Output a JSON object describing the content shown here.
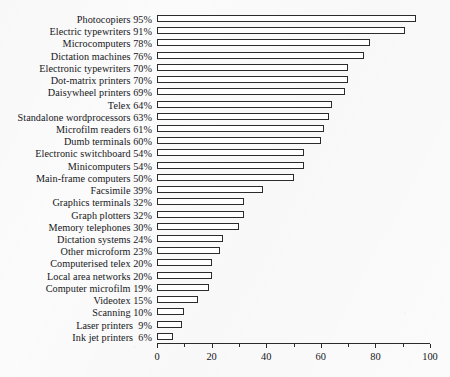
{
  "chart_data": {
    "type": "bar",
    "orientation": "horizontal",
    "title": "",
    "subtitle": "",
    "xlabel": "",
    "ylabel": "",
    "xlim": [
      0,
      100
    ],
    "ylim": null,
    "grid": false,
    "legend": null,
    "legend_position": "none",
    "value_suffix": "%",
    "xticks": [
      0,
      20,
      40,
      60,
      80,
      100
    ],
    "xtick_labels": [
      "0",
      "20",
      "40",
      "60",
      "80",
      "100"
    ],
    "minor_xticks": [
      10,
      30,
      50,
      70,
      90
    ],
    "categories": [
      "Photocopiers",
      "Electric typewriters",
      "Microcomputers",
      "Dictation machines",
      "Electronic typewriters",
      "Dot-matrix printers",
      "Daisywheel printers",
      "Telex",
      "Standalone wordprocessors",
      "Microfilm readers",
      "Dumb terminals",
      "Electronic switchboard",
      "Minicomputers",
      "Main-frame computers",
      "Facsimile",
      "Graphics terminals",
      "Graph plotters",
      "Memory telephones",
      "Dictation systems",
      "Other microform",
      "Computerised telex",
      "Local area networks",
      "Computer microfilm",
      "Videotex",
      "Scanning",
      "Laser printers",
      "Ink jet printers"
    ],
    "values": [
      95,
      91,
      78,
      76,
      70,
      70,
      69,
      64,
      63,
      61,
      60,
      54,
      54,
      50,
      39,
      32,
      32,
      30,
      24,
      23,
      20,
      20,
      19,
      15,
      10,
      9,
      6
    ],
    "row_labels": [
      "Photocopiers 95%",
      "Electric typewriters 91%",
      "Microcomputers 78%",
      "Dictation machines 76%",
      "Electronic typewriters 70%",
      "Dot-matrix printers 70%",
      "Daisywheel printers 69%",
      "Telex 64%",
      "Standalone wordprocessors 63%",
      "Microfilm readers 61%",
      "Dumb terminals 60%",
      "Electronic switchboard 54%",
      "Minicomputers 54%",
      "Main-frame computers 50%",
      "Facsimile 39%",
      "Graphics terminals 32%",
      "Graph plotters 32%",
      "Memory telephones 30%",
      "Dictation systems 24%",
      "Other microform 23%",
      "Computerised telex 20%",
      "Local area networks 20%",
      "Computer microfilm 19%",
      "Videotex 15%",
      "Scanning 10%",
      "Laser printers  9%",
      "Ink jet printers  6%"
    ],
    "colors": {
      "bar_fill": "#ffffff",
      "bar_outline": "#2b2b2e",
      "axis": "#2b2b2e",
      "text": "#17171a",
      "background": "#fbfbfb"
    }
  }
}
